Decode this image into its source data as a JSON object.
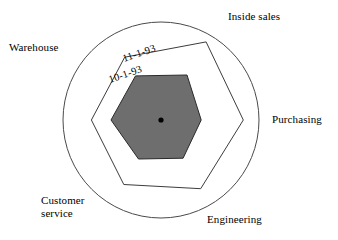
{
  "chart_data": {
    "type": "radar",
    "title": "",
    "categories": [
      "Inside sales",
      "Purchasing",
      "Engineering",
      "Customer service",
      "Warehouse",
      ""
    ],
    "axis_angles_deg": [
      -60,
      0,
      60,
      120,
      180,
      240
    ],
    "grid": false,
    "outer_boundary": "circle",
    "rmax": 100,
    "legend_position": "inline-on-series",
    "series": [
      {
        "name": "11-1-93",
        "label": "11-1-93",
        "filled": false,
        "line_color": "#3c3c3c",
        "fill_color": "none",
        "values": [
          92,
          84,
          81,
          76,
          71,
          74
        ]
      },
      {
        "name": "10-1-93",
        "label": "10-1-93",
        "filled": true,
        "line_color": "#2a2a2a",
        "fill_color": "#6e6e6e",
        "values": [
          53,
          41,
          45,
          46,
          51,
          52
        ]
      }
    ],
    "center_marker": {
      "name": "center-dot",
      "color": "#000000",
      "radius_px": 2.6
    }
  },
  "labels": {
    "inside_sales": "Inside sales",
    "purchasing": "Purchasing",
    "engineering": "Engineering",
    "customer_service": "Customer\nservice",
    "warehouse": "Warehouse"
  },
  "series_labels": {
    "outer": "11-1-93",
    "inner": "10-1-93"
  },
  "colors": {
    "background": "#ffffff",
    "stroke": "#3c3c3c",
    "fill_gray": "#6e6e6e",
    "text": "#000000"
  }
}
